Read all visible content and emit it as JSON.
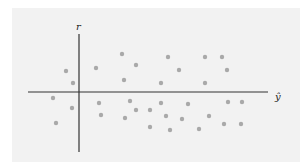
{
  "chart_data": {
    "type": "scatter",
    "title": "",
    "xlabel": "ŷ",
    "ylabel": "r",
    "grid": false,
    "legend": "none",
    "xlim": [
      -2.0,
      7.6
    ],
    "ylim": [
      -2.4,
      2.6
    ],
    "points": [
      {
        "x": -0.52,
        "y": 0.84
      },
      {
        "x": -0.24,
        "y": 0.36
      },
      {
        "x": -1.04,
        "y": -0.24
      },
      {
        "x": -0.28,
        "y": -0.64
      },
      {
        "x": -0.92,
        "y": -1.24
      },
      {
        "x": 0.68,
        "y": 0.96
      },
      {
        "x": 0.8,
        "y": -0.44
      },
      {
        "x": 0.88,
        "y": -0.92
      },
      {
        "x": 1.72,
        "y": 1.52
      },
      {
        "x": 1.8,
        "y": 0.48
      },
      {
        "x": 2.28,
        "y": 1.08
      },
      {
        "x": 2.04,
        "y": -0.36
      },
      {
        "x": 1.84,
        "y": -1.04
      },
      {
        "x": 2.28,
        "y": -0.72
      },
      {
        "x": 2.84,
        "y": -0.72
      },
      {
        "x": 2.84,
        "y": -1.4
      },
      {
        "x": 3.28,
        "y": 0.36
      },
      {
        "x": 3.56,
        "y": 1.4
      },
      {
        "x": 4.0,
        "y": 0.88
      },
      {
        "x": 3.28,
        "y": -0.44
      },
      {
        "x": 3.48,
        "y": -0.96
      },
      {
        "x": 3.64,
        "y": -1.52
      },
      {
        "x": 4.12,
        "y": -1.08
      },
      {
        "x": 4.36,
        "y": -0.48
      },
      {
        "x": 5.04,
        "y": 1.4
      },
      {
        "x": 5.72,
        "y": 1.4
      },
      {
        "x": 5.92,
        "y": 0.88
      },
      {
        "x": 5.04,
        "y": 0.36
      },
      {
        "x": 5.2,
        "y": -0.96
      },
      {
        "x": 4.8,
        "y": -1.48
      },
      {
        "x": 5.8,
        "y": -1.28
      },
      {
        "x": 5.96,
        "y": -0.4
      },
      {
        "x": 6.52,
        "y": -0.4
      },
      {
        "x": 6.48,
        "y": -1.28
      }
    ]
  }
}
